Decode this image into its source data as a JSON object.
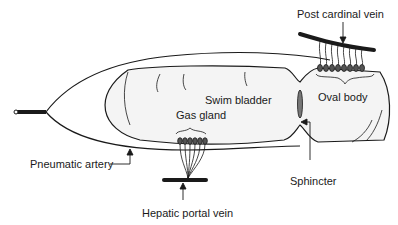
{
  "diagram": {
    "labels": {
      "post_cardinal_vein": "Post cardinal vein",
      "swim_bladder": "Swim bladder",
      "oval_body": "Oval body",
      "gas_gland": "Gas gland",
      "pneumatic_artery": "Pneumatic artery",
      "sphincter": "Sphincter",
      "hepatic_portal_vein": "Hepatic portal vein"
    },
    "colors": {
      "line": "#1a1a1a",
      "bladder_fill": "#f4f4f4",
      "background": "#ffffff"
    }
  }
}
